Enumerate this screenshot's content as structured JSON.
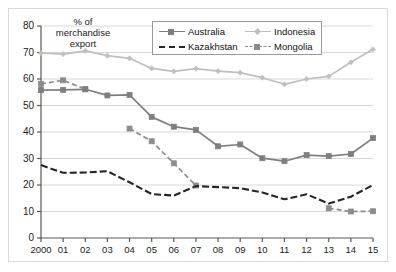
{
  "chart_data": {
    "type": "line",
    "title": "",
    "subtitle": "",
    "xlabel": "",
    "ylabel": "% of merchandise export",
    "ylabel_lines": [
      "% of",
      "merchandise",
      "export"
    ],
    "categories": [
      "2000",
      "01",
      "02",
      "03",
      "04",
      "05",
      "06",
      "07",
      "08",
      "09",
      "10",
      "11",
      "12",
      "13",
      "14",
      "15"
    ],
    "x": [
      2000,
      2001,
      2002,
      2003,
      2004,
      2005,
      2006,
      2007,
      2008,
      2009,
      2010,
      2011,
      2012,
      2013,
      2014,
      2015
    ],
    "ylim": [
      0,
      80
    ],
    "ytick_step": 10,
    "yticks": [
      0,
      10,
      20,
      30,
      40,
      50,
      60,
      70,
      80
    ],
    "grid": "horizontal",
    "legend_position": "top-center",
    "series": [
      {
        "name": "Australia",
        "color": "#7f7f7f",
        "line_style": "solid",
        "marker": "square",
        "values": [
          55.8,
          55.9,
          56.1,
          53.8,
          54.0,
          45.7,
          42.0,
          40.8,
          34.6,
          35.3,
          30.1,
          29.0,
          31.3,
          30.9,
          31.7,
          37.7
        ]
      },
      {
        "name": "Indonesia",
        "color": "#bfbfbf",
        "line_style": "solid",
        "marker": "diamond",
        "values": [
          69.8,
          69.4,
          70.6,
          68.8,
          67.8,
          64.0,
          62.9,
          63.9,
          63.0,
          62.4,
          60.5,
          58.0,
          60.0,
          61.0,
          66.3,
          71.2
        ]
      },
      {
        "name": "Kazakhstan",
        "color": "#262626",
        "line_style": "dashed",
        "marker": "none",
        "values": [
          27.5,
          24.6,
          24.7,
          25.2,
          21.0,
          16.6,
          16.0,
          19.6,
          19.2,
          18.8,
          17.2,
          14.6,
          16.5,
          13.0,
          15.6,
          20.0
        ]
      },
      {
        "name": "Mongolia",
        "color": "#8c8c8c",
        "line_style": "dashed",
        "marker": "square",
        "values": [
          58.2,
          59.5,
          56.2,
          null,
          41.3,
          36.5,
          28.2,
          19.8,
          null,
          null,
          null,
          null,
          null,
          11.2,
          10.0,
          10.1
        ]
      }
    ]
  },
  "legend": {
    "items": [
      {
        "label": "Australia"
      },
      {
        "label": "Indonesia"
      },
      {
        "label": "Kazakhstan"
      },
      {
        "label": "Mongolia"
      }
    ]
  },
  "colors": {
    "australia": "#7f7f7f",
    "indonesia": "#bfbfbf",
    "kazakhstan": "#262626",
    "mongolia": "#8c8c8c",
    "grid": "#d9d9d9",
    "axis": "#595959",
    "border": "#d9d9d9",
    "text": "#222222"
  }
}
